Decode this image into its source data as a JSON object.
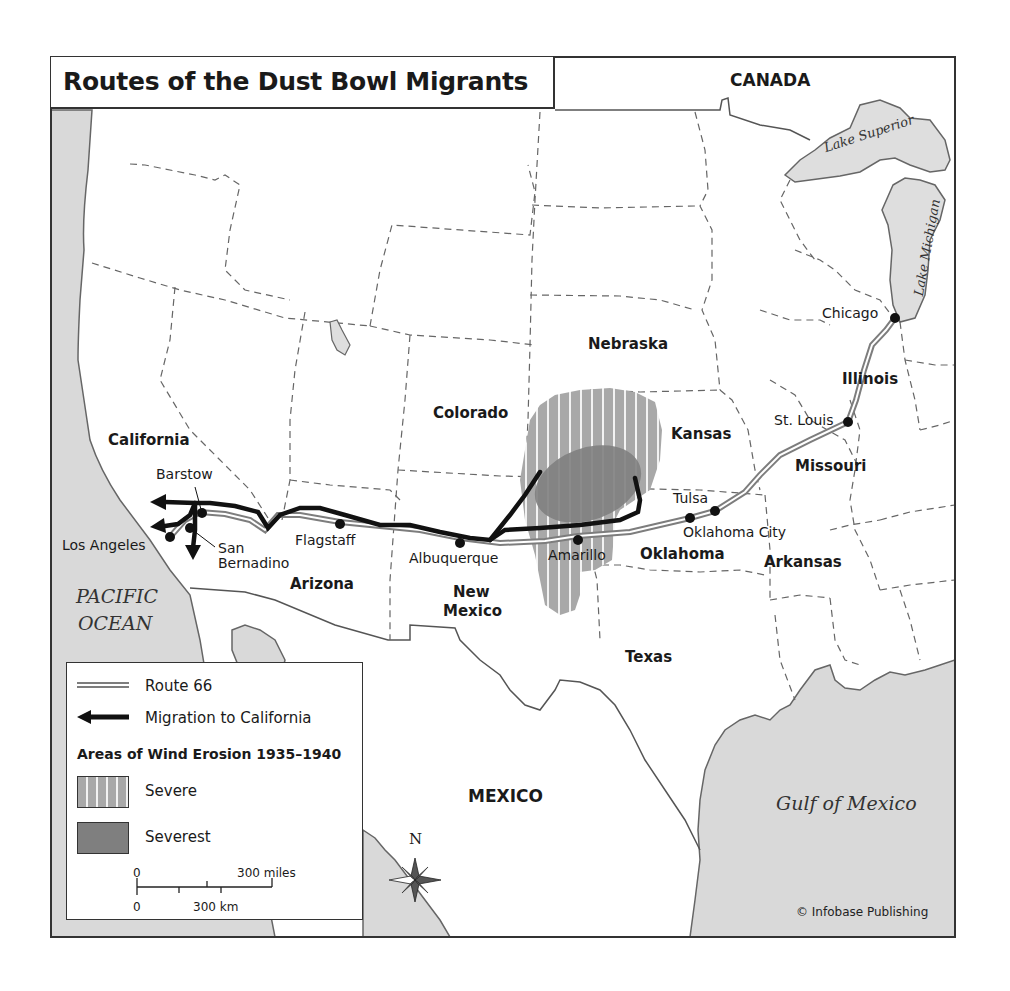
{
  "title": "Routes of the Dust Bowl Migrants",
  "countries": {
    "canada": "CANADA",
    "mexico": "MEXICO"
  },
  "water_bodies": {
    "pacific_line1": "PACIFIC",
    "pacific_line2": "OCEAN",
    "gulf": "Gulf of Mexico",
    "lake_superior": "Lake Superior",
    "lake_michigan": "Lake Michigan"
  },
  "states": {
    "california": "California",
    "arizona": "Arizona",
    "new_mexico_line1": "New",
    "new_mexico_line2": "Mexico",
    "colorado": "Colorado",
    "nebraska": "Nebraska",
    "kansas": "Kansas",
    "oklahoma": "Oklahoma",
    "texas": "Texas",
    "arkansas": "Arkansas",
    "missouri": "Missouri",
    "illinois": "Illinois"
  },
  "cities": {
    "chicago": "Chicago",
    "st_louis": "St. Louis",
    "tulsa": "Tulsa",
    "oklahoma_city": "Oklahoma City",
    "amarillo": "Amarillo",
    "albuquerque": "Albuquerque",
    "flagstaff": "Flagstaff",
    "barstow": "Barstow",
    "san_bernadino_line1": "San",
    "san_bernadino_line2": "Bernadino",
    "los_angeles": "Los Angeles"
  },
  "legend": {
    "route66": "Route 66",
    "migration": "Migration to California",
    "erosion_heading": "Areas of Wind Erosion 1935–1940",
    "severe": "Severe",
    "severest": "Severest",
    "scale_miles_zero": "0",
    "scale_miles_label": "300 miles",
    "scale_km_zero": "0",
    "scale_km_label": "300 km"
  },
  "compass": {
    "north": "N"
  },
  "copyright": "© Infobase Publishing",
  "colors": {
    "water": "#d9d9d9",
    "land": "#ffffff",
    "border": "#555555",
    "route66": "#8a8a8a",
    "migration": "#111111",
    "severe": "#a8a8a8",
    "severest": "#7a7a7a"
  }
}
